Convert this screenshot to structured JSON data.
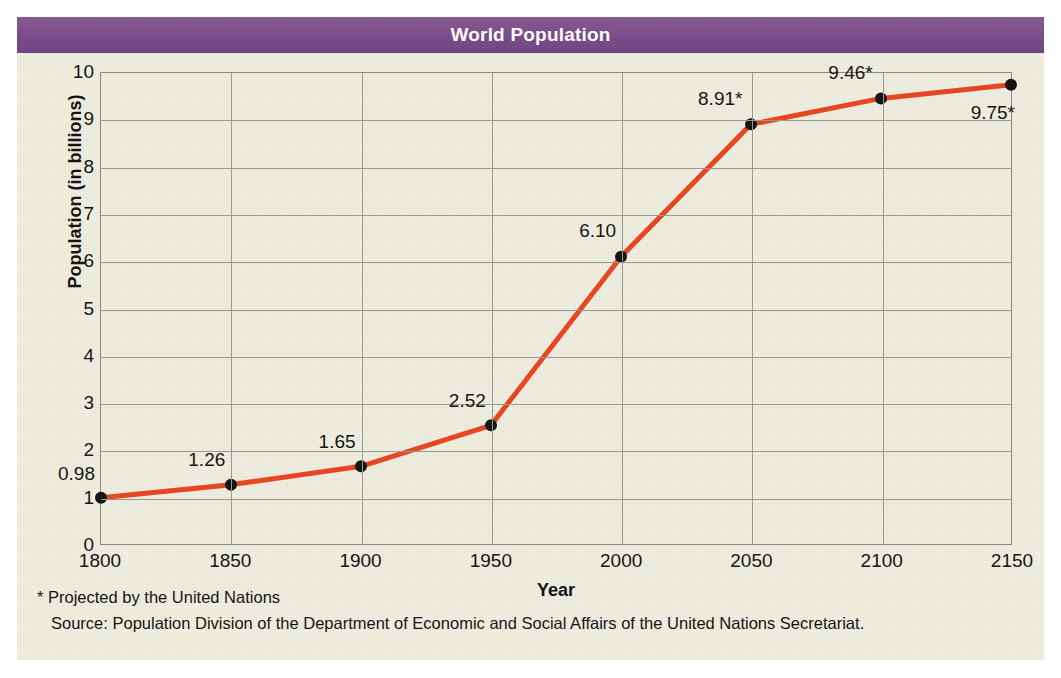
{
  "figure": {
    "title": "World Population",
    "banner_color": "#7c4f8c",
    "background_color": "#efeee0",
    "line_color": "#e8441f",
    "marker_color": "#111111",
    "grid_color": "#9a9a90"
  },
  "footnotes": [
    "* Projected by the United Nations",
    "Source: Population Division of the Department of Economic and Social Affairs of the United Nations Secretariat."
  ],
  "chart_data": {
    "type": "line",
    "title": "World Population",
    "xlabel": "Year",
    "ylabel": "Population (in billions)",
    "xlim": [
      1800,
      2150
    ],
    "ylim": [
      0,
      10
    ],
    "grid": true,
    "legend": false,
    "x": [
      1800,
      1850,
      1900,
      1950,
      2000,
      2050,
      2100,
      2150
    ],
    "xtick_labels": [
      "1800",
      "1850",
      "1900",
      "1950",
      "2000",
      "2050",
      "2100",
      "2150"
    ],
    "ytick_labels": [
      "0",
      "1",
      "2",
      "3",
      "4",
      "5",
      "6",
      "7",
      "8",
      "9",
      "10"
    ],
    "ytick_values": [
      0,
      1,
      2,
      3,
      4,
      5,
      6,
      7,
      8,
      9,
      10
    ],
    "values": [
      0.98,
      1.26,
      1.65,
      2.52,
      6.1,
      8.91,
      9.46,
      9.75
    ],
    "point_labels": [
      "0.98",
      "1.26",
      "1.65",
      "2.52",
      "6.10",
      "8.91*",
      "9.46*",
      "9.75*"
    ],
    "projected_flags": [
      false,
      false,
      false,
      false,
      false,
      true,
      true,
      true
    ],
    "label_offsets": [
      {
        "dx": -6,
        "dy": -26
      },
      {
        "dx": -6,
        "dy": -26
      },
      {
        "dx": -6,
        "dy": -26
      },
      {
        "dx": -6,
        "dy": -26
      },
      {
        "dx": -6,
        "dy": -26
      },
      {
        "dx": -10,
        "dy": -26
      },
      {
        "dx": -10,
        "dy": -26
      },
      {
        "dx": 2,
        "dy": 28
      }
    ]
  }
}
